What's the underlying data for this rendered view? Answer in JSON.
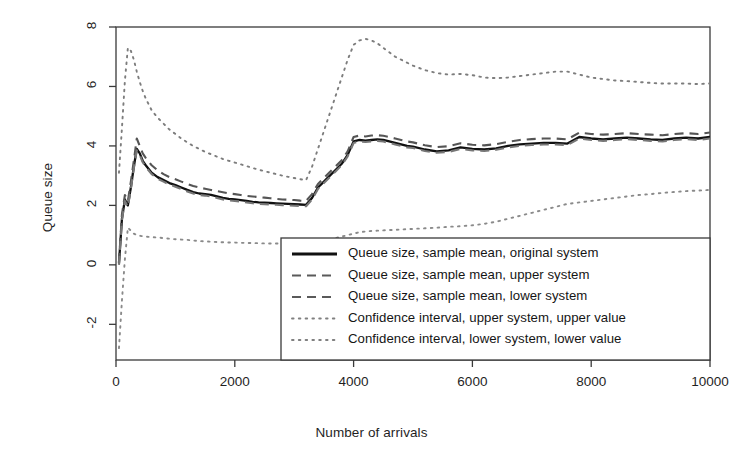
{
  "chart_data": {
    "type": "line",
    "title": "",
    "xlabel": "Number of arrivals",
    "ylabel": "Queue size",
    "xlim": [
      0,
      10000
    ],
    "ylim": [
      -3.2,
      8.0
    ],
    "xticks": [
      0,
      2000,
      4000,
      6000,
      8000,
      10000
    ],
    "xtick_labels": [
      "0",
      "2000",
      "4000",
      "6000",
      "8000",
      "10000"
    ],
    "yticks": [
      -2,
      0,
      2,
      4,
      6,
      8
    ],
    "ytick_labels": [
      "-2",
      "0",
      "2",
      "4",
      "6",
      "8"
    ],
    "grid": false,
    "legend_position": "bottom-right",
    "x": [
      50,
      100,
      150,
      200,
      250,
      300,
      350,
      400,
      450,
      500,
      600,
      700,
      800,
      900,
      1000,
      1100,
      1200,
      1300,
      1400,
      1500,
      1600,
      1700,
      1800,
      1900,
      2000,
      2100,
      2200,
      2300,
      2400,
      2500,
      2600,
      2700,
      2800,
      2900,
      3000,
      3100,
      3200,
      3300,
      3400,
      3500,
      3600,
      3700,
      3800,
      3900,
      4000,
      4100,
      4200,
      4300,
      4400,
      4500,
      4600,
      4700,
      4800,
      4900,
      5000,
      5200,
      5400,
      5600,
      5800,
      6000,
      6200,
      6400,
      6600,
      6800,
      7000,
      7200,
      7400,
      7600,
      7800,
      8000,
      8200,
      8400,
      8600,
      8800,
      9000,
      9200,
      9400,
      9600,
      9800,
      10000
    ],
    "series": [
      {
        "name": "Queue size, sample mean, original system",
        "style": "solid",
        "color": "#111111",
        "values": [
          0.05,
          1.55,
          2.2,
          2.0,
          2.6,
          3.3,
          3.9,
          3.75,
          3.5,
          3.35,
          3.1,
          2.95,
          2.85,
          2.75,
          2.68,
          2.6,
          2.52,
          2.45,
          2.4,
          2.38,
          2.35,
          2.3,
          2.25,
          2.22,
          2.2,
          2.18,
          2.15,
          2.12,
          2.1,
          2.09,
          2.08,
          2.07,
          2.06,
          2.05,
          2.04,
          2.03,
          2.02,
          2.25,
          2.6,
          2.8,
          3.0,
          3.2,
          3.4,
          3.7,
          4.15,
          4.2,
          4.18,
          4.2,
          4.22,
          4.2,
          4.15,
          4.1,
          4.05,
          4.0,
          3.98,
          3.88,
          3.82,
          3.85,
          3.95,
          3.9,
          3.88,
          3.92,
          4.0,
          4.05,
          4.08,
          4.1,
          4.1,
          4.08,
          4.3,
          4.25,
          4.22,
          4.25,
          4.28,
          4.25,
          4.22,
          4.2,
          4.25,
          4.28,
          4.25,
          4.3
        ]
      },
      {
        "name": "Queue size, sample mean, upper system",
        "style": "dashed",
        "color": "#555555",
        "values": [
          0.1,
          1.7,
          2.35,
          2.15,
          2.8,
          3.5,
          4.25,
          4.0,
          3.75,
          3.6,
          3.35,
          3.18,
          3.05,
          2.95,
          2.88,
          2.8,
          2.72,
          2.65,
          2.6,
          2.56,
          2.52,
          2.48,
          2.44,
          2.4,
          2.38,
          2.35,
          2.32,
          2.3,
          2.28,
          2.26,
          2.24,
          2.22,
          2.2,
          2.19,
          2.18,
          2.16,
          2.15,
          2.38,
          2.72,
          2.92,
          3.12,
          3.32,
          3.52,
          3.82,
          4.3,
          4.35,
          4.32,
          4.35,
          4.36,
          4.34,
          4.3,
          4.25,
          4.2,
          4.15,
          4.12,
          4.02,
          3.96,
          3.99,
          4.09,
          4.04,
          4.02,
          4.06,
          4.14,
          4.2,
          4.23,
          4.25,
          4.25,
          4.22,
          4.45,
          4.4,
          4.38,
          4.4,
          4.43,
          4.4,
          4.38,
          4.36,
          4.4,
          4.43,
          4.4,
          4.45
        ]
      },
      {
        "name": "Queue size, sample mean, lower system",
        "style": "dashed",
        "color": "#777777",
        "values": [
          0.0,
          1.5,
          2.15,
          1.95,
          2.55,
          3.25,
          3.85,
          3.7,
          3.45,
          3.3,
          3.05,
          2.9,
          2.8,
          2.7,
          2.63,
          2.55,
          2.47,
          2.4,
          2.35,
          2.33,
          2.3,
          2.25,
          2.2,
          2.17,
          2.15,
          2.13,
          2.1,
          2.07,
          2.05,
          2.04,
          2.03,
          2.02,
          2.01,
          2.0,
          1.99,
          1.98,
          1.97,
          2.2,
          2.55,
          2.75,
          2.95,
          3.15,
          3.35,
          3.65,
          4.1,
          4.15,
          4.13,
          4.15,
          4.17,
          4.15,
          4.1,
          4.05,
          4.0,
          3.95,
          3.93,
          3.83,
          3.77,
          3.8,
          3.9,
          3.85,
          3.83,
          3.87,
          3.95,
          4.0,
          4.03,
          4.05,
          4.05,
          4.03,
          4.25,
          4.2,
          4.17,
          4.2,
          4.23,
          4.2,
          4.17,
          4.15,
          4.2,
          4.23,
          4.2,
          4.25
        ]
      },
      {
        "name": "Confidence interval, upper system, upper value",
        "style": "dotted",
        "color": "#7d7d7d",
        "values": [
          3.1,
          4.6,
          6.2,
          7.3,
          7.2,
          6.9,
          6.5,
          6.15,
          5.85,
          5.6,
          5.2,
          4.95,
          4.75,
          4.55,
          4.4,
          4.25,
          4.12,
          4.0,
          3.9,
          3.8,
          3.72,
          3.64,
          3.56,
          3.5,
          3.44,
          3.38,
          3.32,
          3.26,
          3.2,
          3.15,
          3.1,
          3.05,
          3.0,
          2.96,
          2.92,
          2.88,
          2.85,
          3.3,
          3.9,
          4.5,
          5.1,
          5.7,
          6.3,
          6.9,
          7.4,
          7.55,
          7.6,
          7.55,
          7.45,
          7.3,
          7.15,
          7.0,
          6.9,
          6.8,
          6.7,
          6.55,
          6.45,
          6.4,
          6.42,
          6.38,
          6.3,
          6.28,
          6.3,
          6.35,
          6.4,
          6.45,
          6.5,
          6.5,
          6.4,
          6.3,
          6.25,
          6.2,
          6.18,
          6.15,
          6.12,
          6.1,
          6.1,
          6.1,
          6.08,
          6.1
        ]
      },
      {
        "name": "Confidence interval, lower system, lower value",
        "style": "dotted",
        "color": "#8a8a8a",
        "values": [
          -2.8,
          -1.2,
          0.2,
          1.25,
          1.15,
          1.05,
          1.0,
          0.98,
          0.96,
          0.95,
          0.93,
          0.92,
          0.9,
          0.88,
          0.86,
          0.85,
          0.84,
          0.82,
          0.8,
          0.79,
          0.78,
          0.77,
          0.76,
          0.75,
          0.75,
          0.74,
          0.74,
          0.73,
          0.73,
          0.72,
          0.72,
          0.72,
          0.71,
          0.71,
          0.7,
          0.7,
          0.7,
          0.72,
          0.76,
          0.8,
          0.85,
          0.9,
          0.95,
          1.0,
          1.05,
          1.1,
          1.12,
          1.14,
          1.15,
          1.16,
          1.17,
          1.18,
          1.19,
          1.2,
          1.21,
          1.23,
          1.25,
          1.28,
          1.3,
          1.33,
          1.38,
          1.45,
          1.55,
          1.65,
          1.75,
          1.85,
          1.95,
          2.05,
          2.1,
          2.15,
          2.2,
          2.25,
          2.3,
          2.35,
          2.38,
          2.42,
          2.45,
          2.48,
          2.5,
          2.52
        ]
      }
    ]
  },
  "legend": {
    "items": [
      {
        "label": "Queue size, sample mean, original system",
        "style": "solid"
      },
      {
        "label": "Queue size, sample mean, upper system",
        "style": "dashed"
      },
      {
        "label": "Queue size, sample mean, lower system",
        "style": "dashed"
      },
      {
        "label": "Confidence interval, upper system, upper value",
        "style": "dotted"
      },
      {
        "label": "Confidence interval, lower system, lower value",
        "style": "dotted"
      }
    ]
  },
  "colors": {
    "axis": "#3a3a3a",
    "solid": "#111111",
    "dashed": "#5a5a5a",
    "dotted": "#808080",
    "background": "#ffffff"
  }
}
